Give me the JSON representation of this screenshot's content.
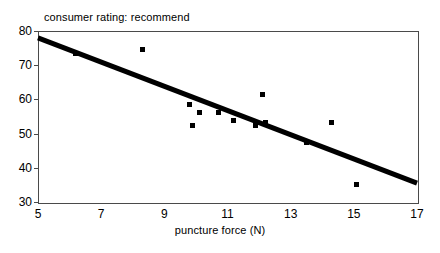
{
  "chart_data": {
    "type": "scatter",
    "title": "consumer rating: recommend",
    "xlabel": "puncture force (N)",
    "ylabel": "",
    "xlim": [
      5,
      17
    ],
    "ylim": [
      30,
      80
    ],
    "grid": false,
    "legend": null,
    "x_ticks": [
      5,
      7,
      9,
      11,
      13,
      15,
      17
    ],
    "x_tick_labels": [
      "5",
      "7",
      "9",
      "11",
      "13",
      "15",
      "17"
    ],
    "y_ticks": [
      30,
      40,
      50,
      60,
      70,
      80
    ],
    "y_tick_labels": [
      "30",
      "40",
      "50",
      "60",
      "70",
      "80"
    ],
    "marker": "square",
    "marker_color": "#000000",
    "points": [
      {
        "x": 6.2,
        "y": 73.5
      },
      {
        "x": 8.3,
        "y": 74.5
      },
      {
        "x": 9.8,
        "y": 58.4
      },
      {
        "x": 10.1,
        "y": 56.3
      },
      {
        "x": 9.9,
        "y": 52.3
      },
      {
        "x": 10.7,
        "y": 56.2
      },
      {
        "x": 11.2,
        "y": 53.8
      },
      {
        "x": 12.1,
        "y": 61.4
      },
      {
        "x": 11.9,
        "y": 52.3
      },
      {
        "x": 12.2,
        "y": 53.2
      },
      {
        "x": 13.5,
        "y": 47.3
      },
      {
        "x": 14.3,
        "y": 53.3
      },
      {
        "x": 15.1,
        "y": 35.2
      }
    ],
    "trendline": {
      "name": "linear fit",
      "x_start": 5,
      "y_start": 78,
      "x_end": 17,
      "y_end": 35.5,
      "color": "#000000",
      "width_px": 5
    }
  }
}
